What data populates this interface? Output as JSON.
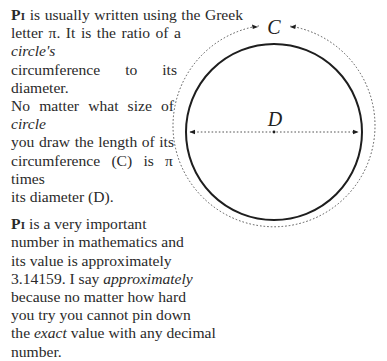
{
  "paragraph1": {
    "lead": "Pi",
    "line1_rest": " is usually written using the Greek",
    "line2_a": "letter π. It is the ratio of a ",
    "line2_em": "circle's",
    "line3": "circumference to its diameter.",
    "line4_a": "No matter what size of ",
    "line4_em": "circle",
    "line5": "you draw the length of its",
    "line6": "circumference (C) is π times",
    "line7": "its diameter (D)."
  },
  "paragraph2": {
    "lead": "Pi",
    "line1_rest": " is a very important",
    "line2": "number in mathematics and",
    "line3": "its value is approximately",
    "line4_a": "3.14159. I say ",
    "line4_em": "approximately",
    "line5": "because no matter how hard",
    "line6": "you try you cannot pin down",
    "line7_a": "the ",
    "line7_em": "exact",
    "line7_b": " value with any decimal",
    "line8": "number."
  },
  "diagram": {
    "circumference_label": "C",
    "diameter_label": "D",
    "circle_color": "#1e1e1e",
    "dotted_color": "#555555"
  }
}
